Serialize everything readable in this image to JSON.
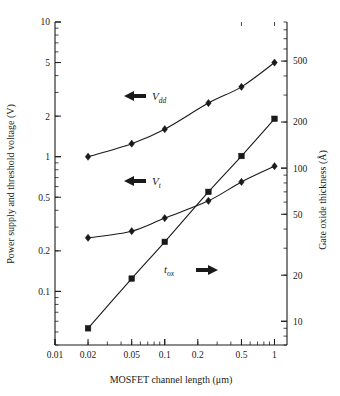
{
  "chart_data": {
    "type": "line",
    "title": "",
    "xlabel": "MOSFET channel length (μm)",
    "ylabel": "Power supply and threshold voltage (V)",
    "y2label": "Gate oxide thickness (Å)",
    "xscale": "log",
    "yscale": "log",
    "y2scale": "log",
    "xlim": [
      0.01,
      1.3
    ],
    "ylim": [
      0.04,
      10
    ],
    "y2lim": [
      7,
      900
    ],
    "grid": false,
    "legend": "inline-annotations",
    "xticks": [
      "0.01",
      "0.02",
      "0.05",
      "0.1",
      "0.2",
      "0.5",
      "1"
    ],
    "xtick_values": [
      0.01,
      0.02,
      0.05,
      0.1,
      0.2,
      0.5,
      1
    ],
    "yticks": [
      "10",
      "5",
      "2",
      "1",
      "0.5",
      "0.2",
      "0.1"
    ],
    "ytick_values": [
      10,
      5,
      2,
      1,
      0.5,
      0.2,
      0.1
    ],
    "y2ticks": [
      "500",
      "200",
      "100",
      "50",
      "20",
      "10"
    ],
    "y2tick_values": [
      500,
      200,
      100,
      50,
      20,
      10
    ],
    "series": [
      {
        "name": "Vdd",
        "label": "V",
        "sublabel": "dd",
        "axis": "left",
        "marker": "diamond",
        "arrow": "left",
        "x": [
          0.02,
          0.05,
          0.1,
          0.25,
          0.5,
          1.0
        ],
        "values": [
          1.0,
          1.25,
          1.6,
          2.5,
          3.3,
          5.0
        ]
      },
      {
        "name": "Vt",
        "label": "V",
        "sublabel": "t",
        "axis": "left",
        "marker": "diamond",
        "arrow": "left",
        "x": [
          0.02,
          0.05,
          0.1,
          0.25,
          0.5,
          1.0
        ],
        "values": [
          0.25,
          0.28,
          0.35,
          0.47,
          0.65,
          0.85
        ]
      },
      {
        "name": "tox",
        "label": "t",
        "sublabel": "ox",
        "axis": "right",
        "marker": "square",
        "arrow": "right",
        "x": [
          0.02,
          0.05,
          0.1,
          0.25,
          0.5,
          1.0
        ],
        "values": [
          9,
          19,
          33,
          70,
          120,
          210
        ]
      }
    ]
  },
  "annotations": {
    "vdd": {
      "label": "V",
      "sub": "dd"
    },
    "vt": {
      "label": "V",
      "sub": "t"
    },
    "tox": {
      "label": "t",
      "sub": "ox"
    }
  },
  "axes": {
    "x_title": "MOSFET channel length (μm)",
    "y_left_title": "Power supply and threshold voltage (V)",
    "y_right_title": "Gate oxide thickness (Å)"
  },
  "colors": {
    "ink": "#1a1a1a",
    "background": "#ffffff"
  }
}
